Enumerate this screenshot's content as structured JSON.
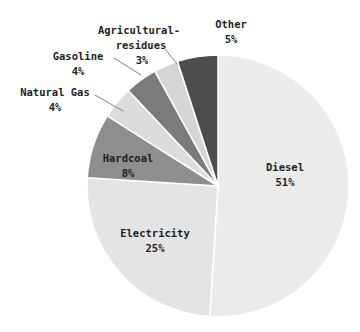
{
  "chart_data": {
    "type": "pie",
    "title": "",
    "unit": "%",
    "direction": "clockwise",
    "start_angle": "top",
    "background_color": "#ffffff",
    "text_color": "#1f1f1f",
    "edge_color": "#ffffff",
    "leader_line_color": "#808080",
    "layout": {
      "cx": 218,
      "cy": 186,
      "r": 131
    },
    "slices": [
      {
        "name": "Diesel",
        "value": 51,
        "percent_label": "51%",
        "color": "#ebebeb",
        "label_placement": "inside",
        "label_lines": [
          {
            "text": "Diesel",
            "x": 285,
            "y": 167
          },
          {
            "text": "51%",
            "x": 285,
            "y": 182
          }
        ],
        "leader": null
      },
      {
        "name": "Electricity",
        "value": 25,
        "percent_label": "25%",
        "color": "#e4e4e4",
        "label_placement": "inside",
        "label_lines": [
          {
            "text": "Electricity",
            "x": 155,
            "y": 233
          },
          {
            "text": "25%",
            "x": 155,
            "y": 248
          }
        ],
        "leader": null
      },
      {
        "name": "Hardcoal",
        "value": 8,
        "percent_label": "8%",
        "color": "#8e8e8e",
        "label_placement": "inside",
        "label_lines": [
          {
            "text": "Hardcoal",
            "x": 128,
            "y": 158
          },
          {
            "text": "8%",
            "x": 128,
            "y": 173
          }
        ],
        "leader": null
      },
      {
        "name": "Natural Gas",
        "value": 4,
        "percent_label": "4%",
        "color": "#dcdcdc",
        "label_placement": "outside",
        "label_lines": [
          {
            "text": "Natural Gas",
            "x": 55,
            "y": 92
          },
          {
            "text": "4%",
            "x": 55,
            "y": 107
          }
        ],
        "leader": {
          "x1": 95,
          "y1": 95,
          "x2": 123,
          "y2": 111
        }
      },
      {
        "name": "Gasoline",
        "value": 4,
        "percent_label": "4%",
        "color": "#7b7b7b",
        "label_placement": "outside",
        "label_lines": [
          {
            "text": "Gasoline",
            "x": 78,
            "y": 56
          },
          {
            "text": "4%",
            "x": 78,
            "y": 71
          }
        ],
        "leader": {
          "x1": 114,
          "y1": 58,
          "x2": 141,
          "y2": 75
        }
      },
      {
        "name": "Agricultural-residues",
        "value": 3,
        "percent_label": "3%",
        "color": "#d5d5d5",
        "label_placement": "outside",
        "label_lines": [
          {
            "text": "Agricultural-",
            "x": 139,
            "y": 30
          },
          {
            "text": "residues",
            "x": 141,
            "y": 45
          },
          {
            "text": "3%",
            "x": 142,
            "y": 60
          }
        ],
        "leader": {
          "x1": 165,
          "y1": 49,
          "x2": 177,
          "y2": 64
        }
      },
      {
        "name": "Other",
        "value": 5,
        "percent_label": "5%",
        "color": "#4d4d4d",
        "label_placement": "outside",
        "label_lines": [
          {
            "text": "Other",
            "x": 231,
            "y": 24
          },
          {
            "text": "5%",
            "x": 231,
            "y": 39
          }
        ],
        "leader": null
      }
    ]
  }
}
